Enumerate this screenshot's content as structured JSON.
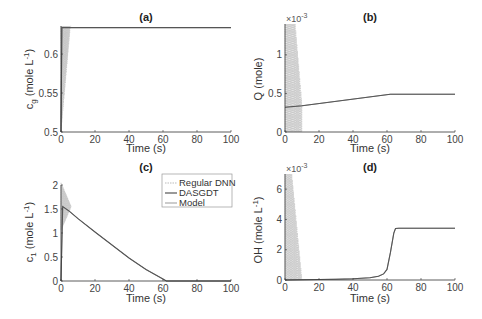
{
  "figure": {
    "legend": [
      "Regular DNN",
      "DASGDT",
      "Model"
    ]
  },
  "chart_data": [
    {
      "panel": "a",
      "type": "line",
      "title": "(a)",
      "xlabel": "Time (s)",
      "ylabel": "c_g (mole L^-1)",
      "ylabel_parts": {
        "main": "c",
        "sub": "g",
        "rest": " (mole L",
        "sup": "-1",
        "end": ")"
      },
      "xlim": [
        0,
        100
      ],
      "ylim": [
        0.5,
        0.636
      ],
      "xticks": [
        0,
        20,
        40,
        60,
        80,
        100
      ],
      "yticks": [
        0.5,
        0.55,
        0.6
      ],
      "ytick_labels": [
        "0.5",
        "0.55",
        "0.6"
      ],
      "exponent": "",
      "grid": false,
      "series": [
        {
          "name": "Regular DNN",
          "style": "oscillating",
          "x": [
            0,
            1,
            2,
            3,
            4,
            5,
            6
          ],
          "y": [
            0.5,
            0.636,
            0.52,
            0.636,
            0.58,
            0.636,
            0.634
          ]
        },
        {
          "name": "DASGDT",
          "x": [
            0,
            0.5,
            100
          ],
          "y": [
            0.5,
            0.634,
            0.634
          ]
        },
        {
          "name": "Model",
          "x": [
            0,
            0.5,
            100
          ],
          "y": [
            0.5,
            0.634,
            0.634
          ]
        }
      ]
    },
    {
      "panel": "b",
      "type": "line",
      "title": "(b)",
      "xlabel": "Time (s)",
      "ylabel": "Q (mole)",
      "ylabel_parts": {
        "main": "Q (mole)",
        "sub": "",
        "rest": "",
        "sup": "",
        "end": ""
      },
      "xlim": [
        0,
        100
      ],
      "ylim": [
        0,
        1.4
      ],
      "xticks": [
        0,
        20,
        40,
        60,
        80,
        100
      ],
      "yticks": [
        0,
        0.5,
        1
      ],
      "ytick_labels": [
        "0",
        "0.5",
        "1"
      ],
      "exponent": "×10-3",
      "exponent_parts": {
        "base": "×10",
        "sup": "-3"
      },
      "grid": false,
      "series": [
        {
          "name": "Regular DNN",
          "style": "oscillating",
          "x": [
            0,
            6,
            10
          ],
          "y": [
            1.4,
            1.4,
            0.3
          ]
        },
        {
          "name": "DASGDT",
          "x": [
            0,
            10,
            62,
            100
          ],
          "y": [
            0.32,
            0.34,
            0.49,
            0.49
          ]
        },
        {
          "name": "Model",
          "x": [
            0,
            10,
            62,
            100
          ],
          "y": [
            0.32,
            0.34,
            0.49,
            0.49
          ]
        }
      ]
    },
    {
      "panel": "c",
      "type": "line",
      "title": "(c)",
      "xlabel": "Time (s)",
      "ylabel": "c_1 (mole L^-1)",
      "ylabel_parts": {
        "main": "c",
        "sub": "1",
        "rest": " (mole L",
        "sup": "-1",
        "end": ")"
      },
      "xlim": [
        0,
        100
      ],
      "ylim": [
        0,
        2
      ],
      "xticks": [
        0,
        20,
        40,
        60,
        80,
        100
      ],
      "yticks": [
        0,
        0.5,
        1,
        1.5,
        2
      ],
      "ytick_labels": [
        "0",
        "0.5",
        "1",
        "1.5",
        "2"
      ],
      "exponent": "",
      "grid": false,
      "legend_position": "upper right",
      "series": [
        {
          "name": "Regular DNN",
          "style": "oscillating",
          "x": [
            0,
            2,
            4,
            6
          ],
          "y": [
            2.0,
            1.2,
            1.7,
            1.45
          ]
        },
        {
          "name": "DASGDT",
          "x": [
            0,
            1,
            5,
            10,
            20,
            30,
            40,
            50,
            60,
            62,
            100
          ],
          "y": [
            0,
            1.55,
            1.45,
            1.3,
            1.02,
            0.75,
            0.48,
            0.24,
            0.04,
            0,
            0
          ]
        },
        {
          "name": "Model",
          "x": [
            0,
            1,
            5,
            10,
            20,
            30,
            40,
            50,
            60,
            62,
            100
          ],
          "y": [
            0,
            1.55,
            1.45,
            1.3,
            1.02,
            0.75,
            0.48,
            0.24,
            0.04,
            0,
            0
          ]
        }
      ]
    },
    {
      "panel": "d",
      "type": "line",
      "title": "(d)",
      "xlabel": "Time (s)",
      "ylabel": "OH (mole L^-1)",
      "ylabel_parts": {
        "main": "OH (mole L",
        "sub": "",
        "rest": "",
        "sup": "-1",
        "end": ")"
      },
      "xlim": [
        0,
        100
      ],
      "ylim": [
        0,
        7
      ],
      "xticks": [
        0,
        20,
        40,
        60,
        80,
        100
      ],
      "yticks": [
        0,
        2,
        4,
        6
      ],
      "ytick_labels": [
        "0",
        "2",
        "4",
        "6"
      ],
      "exponent": "×10-3",
      "exponent_parts": {
        "base": "×10",
        "sup": "-3"
      },
      "grid": false,
      "series": [
        {
          "name": "Regular DNN",
          "style": "oscillating",
          "x": [
            0,
            4,
            10
          ],
          "y": [
            7.0,
            7.0,
            0
          ]
        },
        {
          "name": "DASGDT",
          "x": [
            0,
            10,
            20,
            30,
            40,
            50,
            55,
            58,
            60,
            62,
            64,
            65,
            67,
            100
          ],
          "y": [
            0,
            0.02,
            0.03,
            0.05,
            0.08,
            0.15,
            0.25,
            0.4,
            0.7,
            1.8,
            3.1,
            3.4,
            3.42,
            3.42
          ]
        },
        {
          "name": "Model",
          "x": [
            0,
            10,
            20,
            30,
            40,
            50,
            55,
            58,
            60,
            62,
            64,
            65,
            67,
            100
          ],
          "y": [
            0,
            0.02,
            0.03,
            0.05,
            0.08,
            0.15,
            0.25,
            0.4,
            0.7,
            1.8,
            3.1,
            3.4,
            3.42,
            3.42
          ]
        }
      ]
    }
  ]
}
